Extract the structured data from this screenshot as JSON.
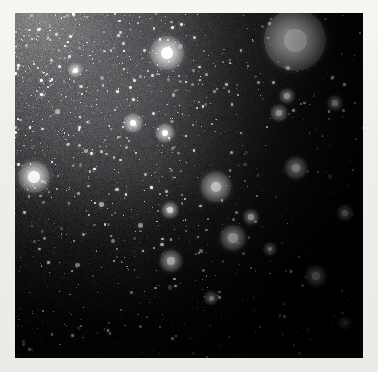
{
  "image": {
    "kind": "astronomical-photograph",
    "subject": "dense Milky Way star field with bright globular-cluster-like object",
    "frame": {
      "x": 15,
      "y": 13,
      "width": 348,
      "height": 345
    },
    "canvas": {
      "width": 378,
      "height": 372
    },
    "border_color": "#f2f1ed",
    "sky_color": "#050506",
    "star_color": "#ffffff",
    "background_glow_color": "#9a9a9c",
    "orientation_note": "bright star cloud toward upper-left, dark dust lane / empty sky toward right and lower-right"
  },
  "chart_data": {
    "type": "scatter",
    "title": "",
    "xlabel": "",
    "ylabel": "",
    "xlim": [
      0,
      348
    ],
    "ylim": [
      0,
      345
    ],
    "grid": false,
    "legend": "none",
    "background_gradient": {
      "description": "diffuse unresolved starlight, brightest at upper-left corner fading to black at right and bottom",
      "bright_corner": [
        0,
        0
      ],
      "dark_corner": [
        348,
        345
      ],
      "peak_luminance": 0.62,
      "min_luminance": 0.01
    },
    "series": [
      {
        "name": "bright objects",
        "points": [
          {
            "x": 280,
            "y": 27,
            "r": 11.5,
            "mag": 1.0,
            "halo": 34,
            "label": "dominant diffuse cluster"
          },
          {
            "x": 152,
            "y": 40,
            "r": 6.0,
            "mag": 0.86,
            "halo": 20,
            "label": "bright star upper-centre"
          },
          {
            "x": 19,
            "y": 164,
            "r": 5.6,
            "mag": 0.84,
            "halo": 19,
            "label": "bright star left edge"
          },
          {
            "x": 201,
            "y": 174,
            "r": 5.4,
            "mag": 0.82,
            "halo": 18,
            "label": "bright star centre"
          },
          {
            "x": 218,
            "y": 225,
            "r": 4.6,
            "mag": 0.78,
            "halo": 15,
            "label": "bright star centre-low"
          },
          {
            "x": 281,
            "y": 155,
            "r": 4.0,
            "mag": 0.74,
            "halo": 13,
            "label": "bright star right"
          },
          {
            "x": 156,
            "y": 248,
            "r": 3.9,
            "mag": 0.74,
            "halo": 13,
            "label": "bright star lower centre"
          },
          {
            "x": 301,
            "y": 263,
            "r": 3.6,
            "mag": 0.72,
            "halo": 12,
            "label": "bright star lower right"
          },
          {
            "x": 118,
            "y": 110,
            "r": 3.4,
            "mag": 0.7,
            "halo": 11,
            "label": "star"
          },
          {
            "x": 150,
            "y": 120,
            "r": 3.3,
            "mag": 0.7,
            "halo": 11,
            "label": "star"
          },
          {
            "x": 264,
            "y": 100,
            "r": 3.0,
            "mag": 0.68,
            "halo": 10,
            "label": "star"
          },
          {
            "x": 155,
            "y": 197,
            "r": 2.9,
            "mag": 0.66,
            "halo": 10,
            "label": "star"
          },
          {
            "x": 330,
            "y": 200,
            "r": 2.8,
            "mag": 0.66,
            "halo": 9,
            "label": "star"
          },
          {
            "x": 272,
            "y": 83,
            "r": 2.7,
            "mag": 0.64,
            "halo": 9,
            "label": "star"
          },
          {
            "x": 320,
            "y": 90,
            "r": 2.6,
            "mag": 0.63,
            "halo": 9,
            "label": "star"
          },
          {
            "x": 236,
            "y": 204,
            "r": 2.6,
            "mag": 0.63,
            "halo": 9,
            "label": "star"
          },
          {
            "x": 196,
            "y": 285,
            "r": 2.5,
            "mag": 0.62,
            "halo": 8,
            "label": "star"
          },
          {
            "x": 60,
            "y": 57,
            "r": 2.5,
            "mag": 0.62,
            "halo": 8,
            "label": "star"
          },
          {
            "x": 330,
            "y": 310,
            "r": 2.4,
            "mag": 0.6,
            "halo": 8,
            "label": "star"
          },
          {
            "x": 255,
            "y": 236,
            "r": 2.3,
            "mag": 0.6,
            "halo": 8,
            "label": "star"
          }
        ]
      },
      {
        "name": "faint field stars",
        "count_approx": 2600,
        "radius_range": [
          0.3,
          1.6
        ],
        "distribution": "density proportional to background glow; densest upper-left, sparse lower-right"
      }
    ]
  }
}
